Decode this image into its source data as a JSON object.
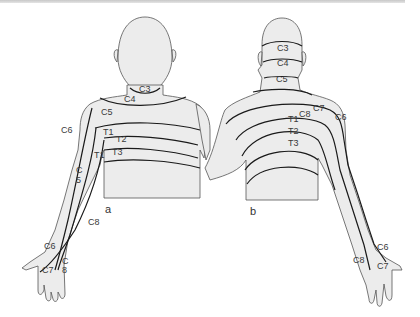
{
  "figure": {
    "colors": {
      "skin": "#ececec",
      "outline": "#555555",
      "dermatome_line": "#1a1a1a",
      "label": "#3a3a3a"
    },
    "panels": [
      {
        "id": "a",
        "label": "a",
        "view": "anterior"
      },
      {
        "id": "b",
        "label": "b",
        "view": "posterior"
      }
    ],
    "anterior_labels": {
      "c3": "C3",
      "c4": "C4",
      "c5": "C5",
      "c6": "C6",
      "t1": "T1",
      "t2": "T2",
      "t3": "T3",
      "t1_arm": "T1",
      "c5_arm_c": "C",
      "c5_arm_5": "5",
      "c8": "C8",
      "c6_hand": "C6",
      "c7_hand": "C7",
      "c8_hand_c": "C",
      "c8_hand_8": "8"
    },
    "posterior_labels": {
      "c3": "C3",
      "c4": "C4",
      "c5": "C5",
      "c7": "C7",
      "c8": "C8",
      "c6": "C6",
      "t1": "T1",
      "t2": "T2",
      "t3": "T3",
      "c6_hand": "C6",
      "c8_hand": "C8",
      "c7_hand": "C7"
    }
  }
}
